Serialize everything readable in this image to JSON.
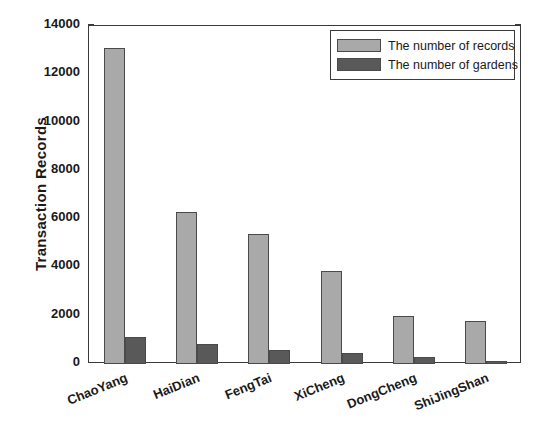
{
  "chart_data": {
    "type": "bar",
    "title": "",
    "subtitle": "",
    "xlabel": "",
    "ylabel": "Transaction Records",
    "categories": [
      "ChaoYang",
      "HaiDian",
      "FengTai",
      "XiCheng",
      "DongCheng",
      "ShiJingShan"
    ],
    "series": [
      {
        "name": "The number of records",
        "color": "#a9a9a9",
        "values": [
          13100,
          6300,
          5380,
          3850,
          1980,
          1780
        ]
      },
      {
        "name": "The number of gardens",
        "color": "#595959",
        "values": [
          1120,
          830,
          570,
          450,
          290,
          110
        ]
      }
    ],
    "ylim": [
      0,
      14000
    ],
    "yticks": [
      0,
      2000,
      4000,
      6000,
      8000,
      10000,
      12000,
      14000
    ],
    "ytick_labels": [
      "0",
      "2000",
      "4000",
      "6000",
      "8000",
      "10000",
      "12000",
      "14000"
    ],
    "grid": false,
    "legend_position": "top-right",
    "axis_color": "#3a3a3a",
    "background": "#ffffff"
  },
  "legend": {
    "entries": [
      {
        "label": "The number of records",
        "swatch": "records"
      },
      {
        "label": "The number of gardens",
        "swatch": "gardens"
      }
    ]
  }
}
